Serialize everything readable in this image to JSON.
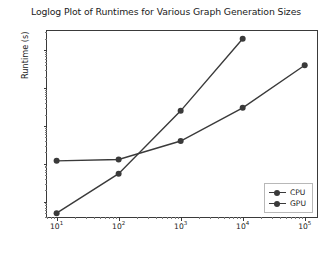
{
  "chart_data": {
    "type": "line",
    "title": "Loglog Plot of Runtimes for Various Graph Generation Sizes",
    "xlabel": "Number of Nodes in Graph",
    "ylabel": "Runtime (s)",
    "xscale": "log",
    "yscale": "log",
    "grid": false,
    "legend_position": "lower right",
    "xlim": [
      7,
      170000
    ],
    "ylim": [
      0.0035,
      320
    ],
    "xticks": [
      10,
      100,
      1000,
      10000,
      100000
    ],
    "xtick_labels": [
      "10¹",
      "10²",
      "10³",
      "10⁴",
      "10⁵"
    ],
    "yticks": [
      0.01,
      0.1,
      1,
      10,
      100
    ],
    "ytick_labels": [
      "10⁻²",
      "10⁻¹",
      "10⁰",
      "10¹",
      "10²"
    ],
    "marker": "o",
    "color": "#3a3a3a",
    "series": [
      {
        "name": "CPU",
        "x": [
          10,
          100,
          1000,
          10000
        ],
        "values": [
          0.005,
          0.055,
          2.5,
          200
        ]
      },
      {
        "name": "GPU",
        "x": [
          10,
          100,
          1000,
          10000,
          100000
        ],
        "values": [
          0.12,
          0.13,
          0.4,
          3.0,
          40
        ]
      }
    ]
  },
  "axes": {
    "title": "Loglog Plot of Runtimes for Various Graph Generation Sizes",
    "xlabel": "Number of Nodes in Graph",
    "ylabel": "Runtime (s)",
    "xtick_labels": [
      {
        "base": "10",
        "exp": "1"
      },
      {
        "base": "10",
        "exp": "2"
      },
      {
        "base": "10",
        "exp": "3"
      },
      {
        "base": "10",
        "exp": "4"
      },
      {
        "base": "10",
        "exp": "5"
      }
    ],
    "ytick_labels": [
      {
        "base": "10",
        "exp": "2"
      },
      {
        "base": "10",
        "exp": "1"
      },
      {
        "base": "10",
        "exp": "0"
      },
      {
        "base": "10",
        "exp": "−1"
      },
      {
        "base": "10",
        "exp": "−2"
      }
    ]
  },
  "legend": {
    "entries": [
      {
        "label": "CPU"
      },
      {
        "label": "GPU"
      }
    ]
  }
}
